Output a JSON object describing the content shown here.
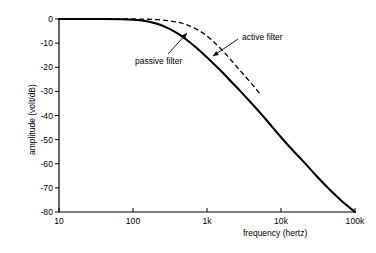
{
  "chart_data": {
    "type": "line",
    "title": "",
    "xlabel": "frequency (hertz)",
    "ylabel": "amplitude (volt/dB)",
    "xscale": "log",
    "xlim": [
      10,
      100000
    ],
    "ylim": [
      -80,
      0
    ],
    "grid": false,
    "legend_position": "inline-annotations",
    "xticks": [
      {
        "value": 10,
        "label": "10"
      },
      {
        "value": 100,
        "label": "100"
      },
      {
        "value": 1000,
        "label": "1k"
      },
      {
        "value": 10000,
        "label": "10k"
      },
      {
        "value": 100000,
        "label": "100k"
      }
    ],
    "yticks": [
      {
        "value": 0,
        "label": "0"
      },
      {
        "value": -10,
        "label": "-10"
      },
      {
        "value": -20,
        "label": "-20"
      },
      {
        "value": -30,
        "label": "-30"
      },
      {
        "value": -40,
        "label": "-40"
      },
      {
        "value": -50,
        "label": "-50"
      },
      {
        "value": -60,
        "label": "-60"
      },
      {
        "value": -70,
        "label": "-70"
      },
      {
        "value": -80,
        "label": "-80"
      }
    ],
    "series": [
      {
        "name": "passive filter",
        "style": "solid",
        "color": "#000000",
        "points": [
          [
            10,
            0.0
          ],
          [
            20,
            0.0
          ],
          [
            40,
            0.0
          ],
          [
            70,
            -0.1
          ],
          [
            100,
            -0.3
          ],
          [
            130,
            -0.6
          ],
          [
            160,
            -1.0
          ],
          [
            200,
            -1.8
          ],
          [
            260,
            -3.0
          ],
          [
            330,
            -4.5
          ],
          [
            420,
            -6.4
          ],
          [
            540,
            -8.8
          ],
          [
            700,
            -11.6
          ],
          [
            900,
            -14.6
          ],
          [
            1200,
            -18.2
          ],
          [
            1600,
            -22.0
          ],
          [
            2100,
            -25.8
          ],
          [
            2800,
            -29.8
          ],
          [
            3800,
            -34.2
          ],
          [
            5200,
            -38.8
          ],
          [
            7000,
            -43.4
          ],
          [
            10000,
            -49.0
          ],
          [
            14000,
            -54.0
          ],
          [
            20000,
            -59.0
          ],
          [
            30000,
            -65.0
          ],
          [
            45000,
            -70.6
          ],
          [
            65000,
            -75.2
          ],
          [
            100000,
            -80.0
          ]
        ]
      },
      {
        "name": "active filter",
        "style": "dashed",
        "color": "#000000",
        "points": [
          [
            10,
            0.0
          ],
          [
            40,
            0.0
          ],
          [
            100,
            0.0
          ],
          [
            160,
            -0.1
          ],
          [
            220,
            -0.3
          ],
          [
            300,
            -0.7
          ],
          [
            400,
            -1.3
          ],
          [
            520,
            -2.3
          ],
          [
            680,
            -3.8
          ],
          [
            900,
            -6.0
          ],
          [
            1150,
            -8.6
          ],
          [
            1500,
            -12.0
          ],
          [
            1900,
            -15.4
          ],
          [
            2400,
            -19.0
          ],
          [
            3000,
            -22.4
          ],
          [
            3800,
            -26.0
          ],
          [
            4600,
            -29.0
          ],
          [
            5200,
            -31.0
          ]
        ]
      }
    ],
    "annotations": [
      {
        "text": "active filter",
        "target_series": "active filter",
        "label_x": 242,
        "label_y": 32,
        "leader_from": [
          238,
          39
        ],
        "leader_to": [
          213,
          56
        ]
      },
      {
        "text": "passive filter",
        "target_series": "passive filter",
        "label_x": 135,
        "label_y": 56,
        "leader_from": [
          168,
          54
        ],
        "leader_to": [
          187,
          33
        ]
      }
    ]
  },
  "axes": {
    "x_title": "frequency (hertz)",
    "y_title": "amplitude (volt/dB)"
  }
}
